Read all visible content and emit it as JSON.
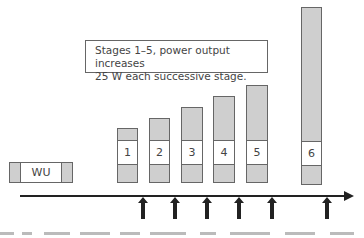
{
  "note": {
    "line1": "Stages 1–5, power output increases",
    "line2": "25 W each successive stage."
  },
  "warmup": {
    "label": "WU"
  },
  "stages": [
    {
      "label": "1",
      "left": 117,
      "top": 128,
      "width": 21
    },
    {
      "label": "2",
      "left": 149,
      "top": 118,
      "width": 21
    },
    {
      "label": "3",
      "left": 181,
      "top": 107,
      "width": 22
    },
    {
      "label": "4",
      "left": 213,
      "top": 96,
      "width": 22
    },
    {
      "label": "5",
      "left": 246,
      "top": 85,
      "width": 22
    },
    {
      "label": "6",
      "left": 301,
      "top": 7,
      "width": 21
    }
  ],
  "arrows_x": [
    143,
    175,
    207,
    239,
    272,
    327
  ],
  "colors": {
    "bar_fill": "#cfcfcf",
    "outline": "#666666",
    "axis": "#222222"
  }
}
